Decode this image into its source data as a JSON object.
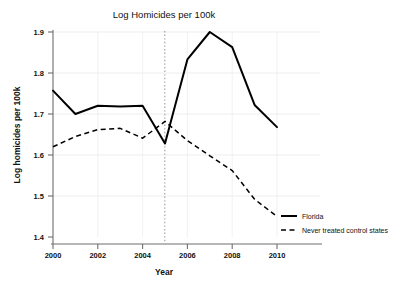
{
  "chart_data": {
    "type": "line",
    "title": "Log Homicides per 100k",
    "xlabel": "Year",
    "ylabel": "Log homicides per 100k",
    "x": [
      2000,
      2001,
      2002,
      2003,
      2004,
      2005,
      2006,
      2007,
      2008,
      2009,
      2010
    ],
    "xticks": [
      "2000",
      "2002",
      "2004",
      "2006",
      "2008",
      "2010"
    ],
    "xtick_values": [
      2000,
      2002,
      2004,
      2006,
      2008,
      2010
    ],
    "yticks": [
      "1.4",
      "1.5",
      "1.6",
      "1.7",
      "1.8",
      "1.9"
    ],
    "ytick_values": [
      1.4,
      1.5,
      1.6,
      1.7,
      1.8,
      1.9
    ],
    "xlim": [
      2000,
      2010
    ],
    "ylim": [
      1.4,
      1.9
    ],
    "grid": true,
    "legend_position": "right-bottom",
    "series": [
      {
        "name": "Florida",
        "style": "solid",
        "color": "#000000",
        "values": [
          1.757,
          1.7,
          1.72,
          1.718,
          1.72,
          1.628,
          1.833,
          1.9,
          1.863,
          1.722,
          1.668
        ]
      },
      {
        "name": "Never treated control states",
        "style": "dashed",
        "color": "#000000",
        "values": [
          1.62,
          1.645,
          1.662,
          1.665,
          1.641,
          1.682,
          1.635,
          1.598,
          1.562,
          1.492,
          1.45
        ]
      }
    ],
    "annotations": [
      {
        "type": "vline",
        "name": "treatment-year-marker",
        "x": 2005,
        "style": "dotted",
        "color": "#9a9a9a",
        "label": "2005"
      }
    ]
  },
  "legend": {
    "items": [
      {
        "label": "Florida",
        "style": "solid"
      },
      {
        "label": "Never treated control states",
        "style": "dashed"
      }
    ]
  }
}
